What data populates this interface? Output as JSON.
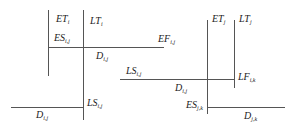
{
  "diagram": {
    "type": "activity-on-node time parameters (node i, node j)",
    "node_i": {
      "ET": {
        "main": "ET",
        "sub": "i"
      },
      "LT": {
        "main": "LT",
        "sub": "i"
      },
      "ES": {
        "main": "ES",
        "sub": "i,j"
      },
      "EF": {
        "main": "EF",
        "sub": "i,j"
      },
      "D_top": {
        "main": "D",
        "sub": "i,j"
      },
      "LS_bottom": {
        "main": "LS",
        "sub": "i,j"
      },
      "D_bottom": {
        "main": "D",
        "sub": "i,j"
      }
    },
    "link": {
      "LS": {
        "main": "LS",
        "sub": "i,j"
      },
      "D": {
        "main": "D",
        "sub": "i,j"
      }
    },
    "node_j": {
      "ET": {
        "main": "ET",
        "sub": "j"
      },
      "LT": {
        "main": "LT",
        "sub": "j"
      },
      "LF": {
        "main": "LF",
        "sub": "i,k"
      },
      "ES": {
        "main": "ES",
        "sub": "j,k"
      },
      "D": {
        "main": "D",
        "sub": "j,k"
      }
    },
    "line_color": "#555555",
    "text_color": "#222222"
  }
}
